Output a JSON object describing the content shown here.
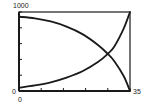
{
  "chart_data": {
    "type": "line",
    "title": "",
    "xlabel": "",
    "ylabel": "",
    "xlim": [
      0,
      35
    ],
    "ylim": [
      0,
      1000
    ],
    "grid": false,
    "legend": null,
    "x_tick_labels": [
      "0",
      "35"
    ],
    "y_tick_labels": [
      "0",
      "1000"
    ],
    "x_ticks": [
      0,
      7,
      14,
      21,
      28,
      35
    ],
    "y_ticks": [
      0,
      200,
      400,
      600,
      800,
      1000
    ],
    "series": [
      {
        "name": "decreasing",
        "x": [
          0,
          5,
          10,
          15,
          20,
          25,
          28,
          30,
          33,
          35
        ],
        "y": [
          940,
          920,
          880,
          815,
          720,
          580,
          470,
          380,
          190,
          0
        ]
      },
      {
        "name": "increasing",
        "x": [
          0,
          5,
          10,
          15,
          20,
          25,
          28,
          30,
          33,
          35
        ],
        "y": [
          40,
          70,
          110,
          170,
          250,
          370,
          470,
          560,
          790,
          1000
        ]
      }
    ],
    "annotations": []
  },
  "labels": {
    "y_top": "1000",
    "y_bottom": "0",
    "x_left": "0",
    "x_right": "35"
  },
  "colors": {
    "line": "#1a1a1a",
    "axis": "#1a1a1a"
  }
}
